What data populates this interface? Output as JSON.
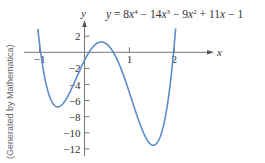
{
  "chart_data": {
    "type": "line",
    "equation": {
      "lhs": "y",
      "terms": [
        {
          "sign": "",
          "coef": "8",
          "var": "x",
          "exp": "4"
        },
        {
          "sign": "−",
          "coef": "14",
          "var": "x",
          "exp": "3"
        },
        {
          "sign": "−",
          "coef": "9",
          "var": "x",
          "exp": "2"
        },
        {
          "sign": "+",
          "coef": "11",
          "var": "x",
          "exp": ""
        },
        {
          "sign": "−",
          "coef": "1",
          "var": "",
          "exp": ""
        }
      ]
    },
    "coefficients": [
      8,
      -14,
      -9,
      11,
      -1
    ],
    "xlabel": "x",
    "ylabel": "y",
    "xlim": [
      -1.35,
      2.85
    ],
    "ylim": [
      -12.5,
      4.5
    ],
    "xticks": [
      -1,
      1,
      2
    ],
    "xtick_labels": [
      "−1",
      "1",
      "2"
    ],
    "yticks": [
      2,
      -2,
      -4,
      -6,
      -8,
      -10,
      -12
    ],
    "ytick_labels": [
      "2",
      "−2",
      "−4",
      "−6",
      "−8",
      "−10",
      "−12"
    ],
    "curve_domain": [
      -1.06,
      2.03
    ],
    "curve_ymax": 3.3,
    "x": [
      -1.0,
      -0.75,
      -0.56,
      -0.25,
      0,
      0.1,
      0.35,
      0.5,
      0.75,
      1.0,
      1.25,
      1.5,
      1.75,
      2.0
    ],
    "y": [
      3.0,
      -5.08,
      -6.62,
      -4.28,
      -1.0,
      -0.05,
      1.17,
      0.75,
      -1.64,
      -5.0,
      -8.9,
      -11.5,
      -10.8,
      -3.0
    ],
    "grid": false,
    "legend": null,
    "line_color": "#5b8ccc",
    "annotation_side": "(Generated by Mathematica)"
  }
}
